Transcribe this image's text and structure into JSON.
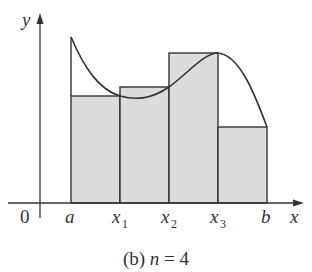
{
  "figure": {
    "caption_prefix": "(b) ",
    "caption_var": "n",
    "caption_rest": " = 4",
    "y_axis_label": "y",
    "x_axis_label": "x",
    "origin_label": "0",
    "tick_labels": [
      {
        "main": "a",
        "sub": ""
      },
      {
        "main": "x",
        "sub": "1"
      },
      {
        "main": "x",
        "sub": "2"
      },
      {
        "main": "x",
        "sub": "3"
      },
      {
        "main": "b",
        "sub": ""
      }
    ],
    "colors": {
      "rect_fill": "#dcdcdc",
      "stroke": "#333333",
      "background": "#ffffff"
    }
  },
  "diagram": {
    "type": "riemann_sum_right_endpoints",
    "n": 4,
    "rectangles": [
      {
        "from": "a",
        "to": "x1",
        "height_px": 107
      },
      {
        "from": "x1",
        "to": "x2",
        "height_px": 116
      },
      {
        "from": "x2",
        "to": "x3",
        "height_px": 150
      },
      {
        "from": "x3",
        "to": "b",
        "height_px": 76
      }
    ]
  }
}
